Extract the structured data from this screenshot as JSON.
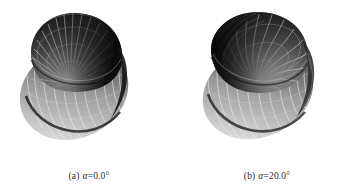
{
  "figure": {
    "background_color": "#ffffff",
    "subfigures": [
      {
        "id": "subfig-a",
        "caption_label": "(a)",
        "caption_symbol": "α",
        "caption_equals": "=",
        "caption_value": "0.0°",
        "caption_full": "(a)  α = 0.0°",
        "alpha_degrees": 0.0,
        "graphic_name": "3d-lobed-surface-plot",
        "graphic_description": "Grayscale shaded three-dimensional lobed surface with radial meridian wireframe lines converging at a bright central highlight",
        "colors": {
          "surface_dark": "#1c1c1c",
          "surface_mid": "#6e6e6e",
          "surface_light": "#c8c8c8",
          "highlight": "#f2f2f2",
          "wireframe": "#e8e8e8",
          "rim_shadow": "#0d0d0d"
        }
      },
      {
        "id": "subfig-b",
        "caption_label": "(b)",
        "caption_symbol": "α",
        "caption_equals": "=",
        "caption_value": "20.0°",
        "caption_full": "(b)  α = 20.0°",
        "alpha_degrees": 20.0,
        "graphic_name": "3d-lobed-surface-plot-rotated",
        "graphic_description": "Grayscale shaded three-dimensional lobed surface, twisted, with swirled meridian wireframe lines and a bright off-center highlight",
        "colors": {
          "surface_dark": "#1f1f1f",
          "surface_mid": "#757575",
          "surface_light": "#cdcdcd",
          "highlight": "#f4f4f4",
          "wireframe": "#ebebeb",
          "rim_shadow": "#101010"
        }
      }
    ]
  }
}
